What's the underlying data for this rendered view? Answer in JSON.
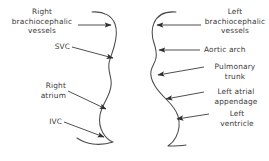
{
  "figure": {
    "type": "anatomical-line-diagram",
    "background_color": "#ffffff",
    "stroke_color": "#4a4a4a",
    "text_color": "#3a3a3a"
  },
  "left_panel": {
    "contour_name": "right-heart-border-contour",
    "labels": [
      {
        "id": "right-brachiocephalic-vessels",
        "text": "Right\nbrachiocephalic\nvessels",
        "arrow_from": [
          78,
          25
        ],
        "arrow_to": [
          111,
          25
        ]
      },
      {
        "id": "svc",
        "text": "SVC",
        "arrow_from": [
          72,
          47
        ],
        "arrow_to": [
          113,
          58
        ]
      },
      {
        "id": "right-atrium",
        "text": "Right\natrium",
        "arrow_from": [
          68,
          91
        ],
        "arrow_to": [
          106,
          109
        ]
      },
      {
        "id": "ivc",
        "text": "IVC",
        "arrow_from": [
          64,
          122
        ],
        "arrow_to": [
          104,
          137
        ]
      }
    ]
  },
  "right_panel": {
    "contour_name": "left-heart-border-contour",
    "labels": [
      {
        "id": "left-brachiocephalic-vessels",
        "text": "Left\nbrachiocephalic\nvessels",
        "arrow_from": [
          201,
          25
        ],
        "arrow_to": [
          157,
          25
        ]
      },
      {
        "id": "aortic-arch",
        "text": "Aortic arch",
        "arrow_from": [
          200,
          50
        ],
        "arrow_to": [
          159,
          50
        ]
      },
      {
        "id": "pulmonary-trunk",
        "text": "Pulmonary\ntrunk",
        "arrow_from": [
          204,
          67
        ],
        "arrow_to": [
          158,
          75
        ]
      },
      {
        "id": "left-atrial-appendage",
        "text": "Left atrial\nappendage",
        "arrow_from": [
          204,
          92
        ],
        "arrow_to": [
          166,
          99
        ]
      },
      {
        "id": "left-ventricle",
        "text": "Left\nventricle",
        "arrow_from": [
          209,
          114
        ],
        "arrow_to": [
          177,
          119
        ]
      }
    ]
  }
}
